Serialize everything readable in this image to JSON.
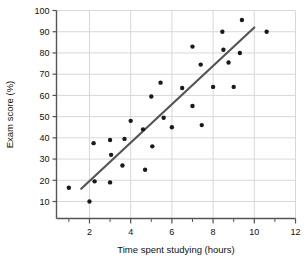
{
  "chart_data": {
    "type": "scatter",
    "title": "",
    "xlabel": "Time spent studying (hours)",
    "ylabel": "Exam score (%)",
    "xlim": [
      0.4,
      12.0
    ],
    "ylim": [
      2,
      100
    ],
    "xticks": [
      2,
      4,
      6,
      8,
      10,
      12
    ],
    "xminorticks": [
      1,
      3,
      5,
      7,
      9,
      11
    ],
    "yticks": [
      10,
      20,
      30,
      40,
      50,
      60,
      70,
      80,
      90,
      100
    ],
    "xtick_labels": [
      "2",
      "4",
      "6",
      "8",
      "10",
      "12"
    ],
    "ytick_labels": [
      "10",
      "20",
      "30",
      "40",
      "50",
      "60",
      "70",
      "80",
      "90",
      "100"
    ],
    "grid": true,
    "grid_color": "#d8d8d8",
    "legend": "none",
    "marker_color": "#1a1a1a",
    "marker_size": 2.2,
    "points": [
      {
        "x": 1.0,
        "y": 16.5
      },
      {
        "x": 2.0,
        "y": 10.0
      },
      {
        "x": 2.2,
        "y": 37.5
      },
      {
        "x": 2.25,
        "y": 19.5
      },
      {
        "x": 3.0,
        "y": 39.0
      },
      {
        "x": 3.0,
        "y": 19.0
      },
      {
        "x": 3.05,
        "y": 32.0
      },
      {
        "x": 3.6,
        "y": 27.0
      },
      {
        "x": 3.7,
        "y": 39.5
      },
      {
        "x": 4.0,
        "y": 48.0
      },
      {
        "x": 4.6,
        "y": 44.0
      },
      {
        "x": 4.7,
        "y": 25.0
      },
      {
        "x": 5.0,
        "y": 59.5
      },
      {
        "x": 5.05,
        "y": 36.0
      },
      {
        "x": 5.45,
        "y": 66.0
      },
      {
        "x": 5.6,
        "y": 49.5
      },
      {
        "x": 6.0,
        "y": 45.0
      },
      {
        "x": 6.5,
        "y": 63.5
      },
      {
        "x": 7.0,
        "y": 83.0
      },
      {
        "x": 7.0,
        "y": 55.0
      },
      {
        "x": 7.4,
        "y": 74.5
      },
      {
        "x": 7.45,
        "y": 46.0
      },
      {
        "x": 8.0,
        "y": 64.0
      },
      {
        "x": 8.45,
        "y": 90.0
      },
      {
        "x": 8.5,
        "y": 81.5
      },
      {
        "x": 8.75,
        "y": 75.5
      },
      {
        "x": 9.0,
        "y": 64.0
      },
      {
        "x": 9.3,
        "y": 80.0
      },
      {
        "x": 9.4,
        "y": 95.5
      },
      {
        "x": 10.6,
        "y": 90.0
      }
    ],
    "trendline": {
      "name": "line of best fit",
      "color": "#555555",
      "width": 2.2,
      "x0": 1.6,
      "y0": 16.0,
      "x1": 10.0,
      "y1": 92.0
    }
  }
}
